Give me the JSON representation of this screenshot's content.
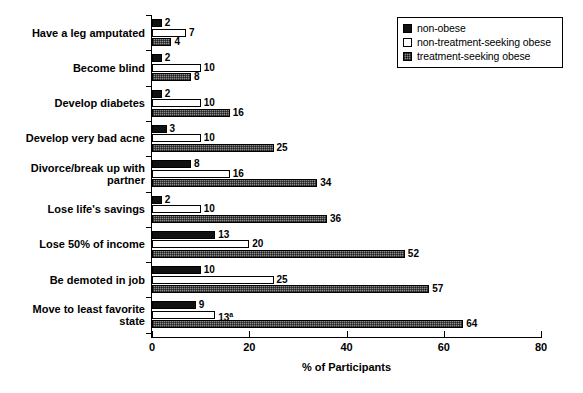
{
  "chart_data": {
    "type": "bar",
    "orientation": "horizontal",
    "title": "",
    "xlabel": "% of Participants",
    "ylabel": "",
    "xlim": [
      0,
      80
    ],
    "xticks": [
      0,
      20,
      40,
      60,
      80
    ],
    "grid": false,
    "legend_position": "top-right",
    "categories": [
      "Have a leg amputated",
      "Become blind",
      "Develop diabetes",
      "Develop very bad acne",
      "Divorce/break up with\npartner",
      "Lose life's savings",
      "Lose 50% of income",
      "Be demoted in job",
      "Move to least favorite\nstate"
    ],
    "series": [
      {
        "name": "non-obese",
        "fill": "solid-black",
        "values": [
          2,
          2,
          2,
          3,
          8,
          2,
          13,
          10,
          9
        ],
        "labels": [
          "2",
          "2",
          "2",
          "3",
          "8",
          "2",
          "13",
          "10",
          "9"
        ]
      },
      {
        "name": "non-treatment-seeking obese",
        "fill": "open-white",
        "values": [
          7,
          10,
          10,
          10,
          16,
          10,
          20,
          25,
          13
        ],
        "labels": [
          "7",
          "10",
          "10",
          "10",
          "16",
          "10",
          "20",
          "25",
          "13"
        ],
        "label_superscripts": [
          "",
          "",
          "",
          "",
          "",
          "",
          "",
          "",
          "a"
        ]
      },
      {
        "name": "treatment-seeking obese",
        "fill": "cross-hatch-gray",
        "values": [
          4,
          8,
          16,
          25,
          34,
          36,
          52,
          57,
          64
        ],
        "labels": [
          "4",
          "8",
          "16",
          "25",
          "34",
          "36",
          "52",
          "57",
          "64"
        ]
      }
    ]
  },
  "legend": {
    "items": [
      {
        "label": "non-obese",
        "swatch": "solid-black"
      },
      {
        "label": "non-treatment-seeking obese",
        "swatch": "open-white"
      },
      {
        "label": "treatment-seeking obese",
        "swatch": "cross-hatch-gray"
      }
    ]
  },
  "colors": {
    "non_obese": "#111111",
    "non_treatment_seeking_obese": "#ffffff",
    "treatment_seeking_obese": "#8e8e8e",
    "axis": "#000000",
    "background": "#ffffff"
  }
}
